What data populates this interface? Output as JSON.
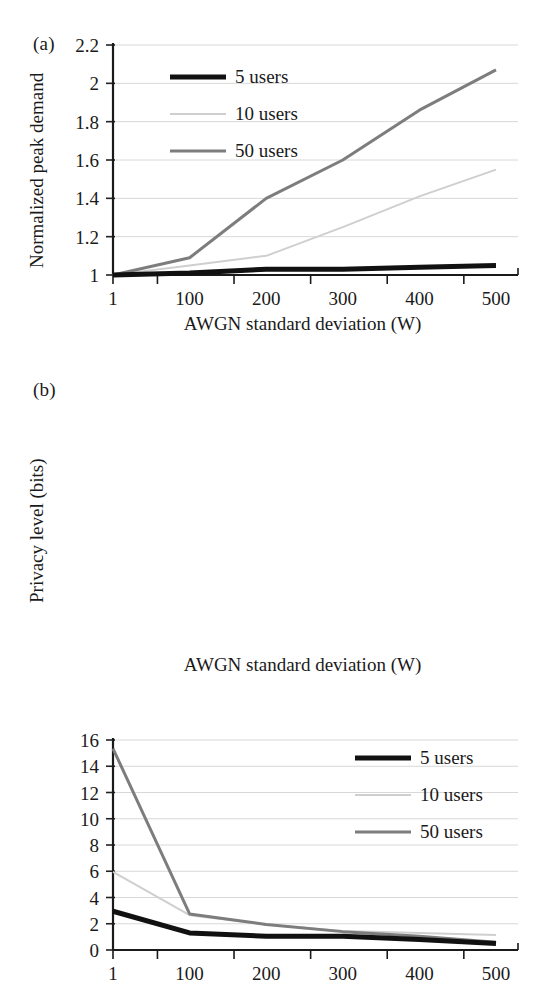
{
  "figure": {
    "panels": [
      {
        "tag": "(a)",
        "ylabel": "Normalized peak demand",
        "xlabel": "AWGN standard deviation (W)"
      },
      {
        "tag": "(b)",
        "ylabel": "Privacy level (bits)",
        "xlabel": "AWGN standard deviation (W)"
      }
    ]
  },
  "series_colors": {
    "5 users": "#111111",
    "10 users": "#cfcfcf",
    "50 users": "#7d7d7d"
  },
  "chart_data": [
    {
      "type": "line",
      "panel": "(a)",
      "title": "",
      "xlabel": "AWGN standard deviation (W)",
      "ylabel": "Normalized peak demand",
      "categories": [
        "1",
        "100",
        "200",
        "300",
        "400",
        "500"
      ],
      "xticklabels": [
        "1",
        "100",
        "200",
        "300",
        "400",
        "500"
      ],
      "yticklabels": [
        "1",
        "1.2",
        "1.4",
        "1.6",
        "1.8",
        "2",
        "2.2"
      ],
      "ylim": [
        1,
        2.2
      ],
      "ytick_step": 0.2,
      "grid": "horizontal",
      "legend_position": "upper-left-inside",
      "series": [
        {
          "name": "5 users",
          "values": [
            1.0,
            1.01,
            1.03,
            1.03,
            1.04,
            1.05
          ]
        },
        {
          "name": "10 users",
          "values": [
            1.0,
            1.05,
            1.1,
            1.25,
            1.41,
            1.55
          ]
        },
        {
          "name": "50 users",
          "values": [
            1.0,
            1.09,
            1.4,
            1.6,
            1.86,
            2.07
          ]
        }
      ]
    },
    {
      "type": "line",
      "panel": "(b)",
      "title": "",
      "xlabel": "AWGN standard deviation (W)",
      "ylabel": "Privacy level (bits)",
      "categories": [
        "1",
        "100",
        "200",
        "300",
        "400",
        "500"
      ],
      "xticklabels": [
        "1",
        "100",
        "200",
        "300",
        "400",
        "500"
      ],
      "yticklabels": [
        "0",
        "2",
        "4",
        "6",
        "8",
        "10",
        "12",
        "14",
        "16"
      ],
      "ylim": [
        0,
        16
      ],
      "ytick_step": 2,
      "grid": "horizontal",
      "legend_position": "upper-right-inside",
      "series": [
        {
          "name": "5 users",
          "values": [
            2.95,
            1.3,
            1.05,
            1.05,
            0.8,
            0.5
          ]
        },
        {
          "name": "10 users",
          "values": [
            5.95,
            2.65,
            1.95,
            1.45,
            1.3,
            1.15
          ]
        },
        {
          "name": "50 users",
          "values": [
            15.35,
            2.75,
            1.95,
            1.4,
            1.05,
            0.6
          ]
        }
      ]
    }
  ],
  "legends": [
    {
      "panel": "(a)",
      "entries": [
        "5 users",
        "10 users",
        "50 users"
      ]
    },
    {
      "panel": "(b)",
      "entries": [
        "5 users",
        "10 users",
        "50 users"
      ]
    }
  ]
}
